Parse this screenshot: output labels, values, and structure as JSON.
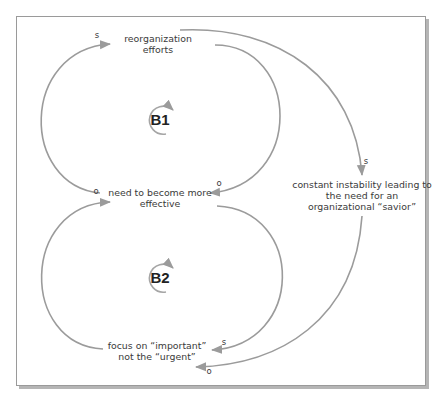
{
  "diagram": {
    "type": "causal-loop-diagram",
    "variables": {
      "reorganization": [
        "reorganization",
        "efforts"
      ],
      "need_effective": [
        "need to become more",
        "effective"
      ],
      "instability": [
        "constant instability leading to",
        "the need for an",
        "organizational “savior”"
      ],
      "focus": [
        "focus on “important”",
        "not the “urgent”"
      ]
    },
    "loops": [
      {
        "label": "B1",
        "type": "balancing",
        "direction": "clockwise"
      },
      {
        "label": "B2",
        "type": "balancing",
        "direction": "clockwise"
      }
    ],
    "links": [
      {
        "from": "need to become more effective",
        "to": "reorganization efforts",
        "polarity": "s"
      },
      {
        "from": "reorganization efforts",
        "to": "need to become more effective",
        "polarity": "o"
      },
      {
        "from": "reorganization efforts",
        "to": "constant instability leading to the need for an organizational savior",
        "polarity": "s"
      },
      {
        "from": "focus on important not the urgent",
        "to": "need to become more effective",
        "polarity": "o"
      },
      {
        "from": "need to become more effective",
        "to": "focus on important not the urgent",
        "polarity": "s"
      },
      {
        "from": "constant instability leading to the need for an organizational savior",
        "to": "focus on important not the urgent",
        "polarity": "o"
      }
    ],
    "polarity_labels": {
      "link1": "s",
      "link2": "o",
      "link3": "s",
      "link4": "o",
      "link5": "s",
      "link6": "o"
    },
    "colors": {
      "arrow": "#9b9b9b",
      "text": "#3a3a3a",
      "frame": "#9a9a9a"
    }
  }
}
